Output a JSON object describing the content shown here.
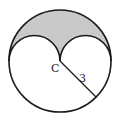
{
  "diagram": {
    "title": "",
    "center_label": "C",
    "radius_label": "3",
    "colors": {
      "stroke": "#1a1a1a",
      "shaded_fill": "#c9c9c9",
      "background": "#ffffff"
    },
    "shapes": {
      "big_circle": {
        "cx": 60,
        "cy": 61,
        "r": 51
      },
      "left_semicircle": {
        "cx": 34.5,
        "cy": 61,
        "r": 25.5
      },
      "right_semicircle": {
        "cx": 85.5,
        "cy": 61,
        "r": 25.5
      },
      "radius_segment": {
        "x1": 60,
        "y1": 61,
        "x2": 96,
        "y2": 97
      }
    }
  }
}
